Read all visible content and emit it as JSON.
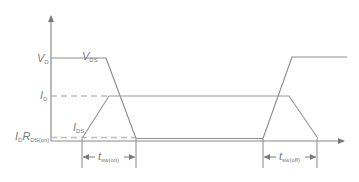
{
  "diagram": {
    "colors": {
      "axis": "#8a8a8a",
      "voltage": "#8f8f8f",
      "current": "#9a9a9a",
      "dashed": "#bdbdbd",
      "text": "#7a7a7a"
    },
    "y_labels": {
      "vd_main": "V",
      "vd_sub": "D",
      "id_main": "I",
      "id_sub": "D",
      "idr_main1": "I",
      "idr_sub1": "D",
      "idr_main2": "R",
      "idr_sub2": "DS(on)"
    },
    "curve_labels": {
      "vds_main": "V",
      "vds_sub": "DS",
      "ids_main": "I",
      "ids_sub": "DS"
    },
    "timing_labels": {
      "ton_main": "t",
      "ton_sub": "sw(on)",
      "toff_main": "t",
      "toff_sub": "sw(off)"
    }
  }
}
